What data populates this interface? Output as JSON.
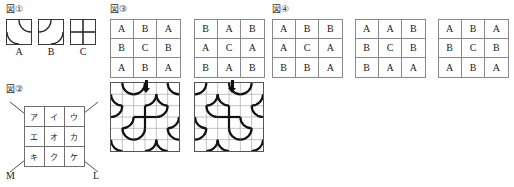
{
  "figures": {
    "fig1": {
      "label": "図①",
      "tiles": [
        {
          "name": "A",
          "type": "arc-tr-bl"
        },
        {
          "name": "B",
          "type": "arc-tl-br"
        },
        {
          "name": "C",
          "type": "cross"
        }
      ],
      "captions": [
        "A",
        "B",
        "C"
      ]
    },
    "fig2": {
      "label": "図②",
      "cells": [
        [
          "ア",
          "イ",
          "ウ"
        ],
        [
          "エ",
          "オ",
          "カ"
        ],
        [
          "キ",
          "ク",
          "ケ"
        ]
      ],
      "diagonal_labels": {
        "left": "M",
        "right": "L"
      }
    },
    "fig3": {
      "label": "図③",
      "grids": [
        {
          "rows": [
            [
              "A",
              "B",
              "A"
            ],
            [
              "B",
              "C",
              "B"
            ],
            [
              "A",
              "B",
              "A"
            ]
          ]
        },
        {
          "rows": [
            [
              "B",
              "A",
              "B"
            ],
            [
              "A",
              "C",
              "A"
            ],
            [
              "B",
              "A",
              "B"
            ]
          ]
        }
      ],
      "arrow": "down-arrow"
    },
    "fig4": {
      "label": "図④",
      "grids": [
        {
          "rows": [
            [
              "A",
              "B",
              "B"
            ],
            [
              "A",
              "C",
              "A"
            ],
            [
              "B",
              "B",
              "A"
            ]
          ]
        },
        {
          "rows": [
            [
              "A",
              "A",
              "B"
            ],
            [
              "B",
              "C",
              "B"
            ],
            [
              "B",
              "A",
              "A"
            ]
          ]
        },
        {
          "rows": [
            [
              "A",
              "B",
              "A"
            ],
            [
              "B",
              "C",
              "B"
            ],
            [
              "A",
              "B",
              "A"
            ]
          ]
        }
      ]
    }
  },
  "colors": {
    "ink": "#1a1a1a",
    "grid_line": "#888888",
    "tile_border": "#3a3a3a",
    "pattern_stroke": "#111111",
    "pattern_grid": "#9a9a9a"
  }
}
